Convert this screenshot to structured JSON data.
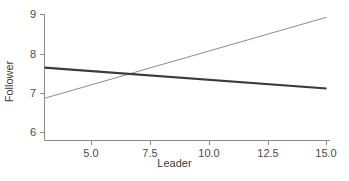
{
  "chart_data": {
    "type": "line",
    "title": "",
    "xlabel": "Leader",
    "ylabel": "Follower",
    "xlim": [
      2.6,
      15.0
    ],
    "ylim": [
      5.65,
      9.0
    ],
    "xticks": [
      5.0,
      7.5,
      10.0,
      12.5,
      15.0
    ],
    "xtick_labels": [
      "5.0",
      "7.5",
      "10.0",
      "12.5",
      "15.0"
    ],
    "yticks": [
      6,
      7,
      8,
      9
    ],
    "ytick_labels": [
      "6",
      "7",
      "8",
      "9"
    ],
    "grid": false,
    "legend": null,
    "series": [
      {
        "name": "declining-line",
        "style": "thick-dark",
        "color": "#3a3a3a",
        "linewidth": 2.1,
        "x": [
          2.6,
          15.0
        ],
        "y": [
          7.65,
          7.12
        ]
      },
      {
        "name": "rising-line",
        "style": "thin-gray",
        "color": "#8c8c8c",
        "linewidth": 1.0,
        "x": [
          2.6,
          15.0
        ],
        "y": [
          6.87,
          8.93
        ]
      }
    ],
    "annotations": [
      {
        "name": "crossing-point",
        "x": 6.5,
        "y": 7.45
      }
    ]
  },
  "axes": {
    "x_axis_color": "#8a8a8a",
    "y_axis_color": "#8a8a8a",
    "tick_color": "#8a8a8a"
  }
}
